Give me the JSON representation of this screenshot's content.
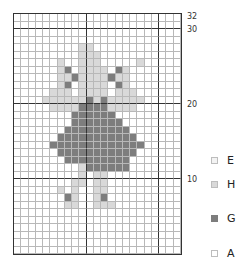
{
  "chart_data": {
    "type": "heatmap",
    "title": "",
    "grid": {
      "rows": 32,
      "cols": 23
    },
    "row_labels": [
      {
        "label": "32",
        "row_from_bottom": 32
      },
      {
        "label": "30",
        "row_from_bottom": 30
      },
      {
        "label": "20",
        "row_from_bottom": 20
      },
      {
        "label": "10",
        "row_from_bottom": 10
      }
    ],
    "thick_lines": {
      "after_cols": [
        10,
        20
      ],
      "after_rows_from_top": [
        2,
        12,
        22
      ]
    },
    "legend": [
      {
        "key": "E",
        "color": "#f3f3f3"
      },
      {
        "key": "H",
        "color": "#d9d9d9"
      },
      {
        "key": "G",
        "color": "#7d7d7d"
      },
      {
        "key": "A",
        "color": "#ffffff"
      }
    ],
    "pattern_rows_top_to_bottom": [
      "AAAAAAAAAAAAAAAAAAAAAAA",
      "AAAAAAAAAAAAAAAAAAAAAAA",
      "AAAAAAAAAAAAAAAAAAAAAAA",
      "AAAAAAAAAAAAAAAAAAAAAAA",
      "AAAAAAAAAHHAAAAAAAAAAAA",
      "AAAAAAAAAHHHAAAAAAAAAAA",
      "AAAAAAHAAHHHAAAAAHAAAAA",
      "AAAAAAHGAHHHHAGHAAAAAAA",
      "AAAAAAHHGHHHHGHHAAAAAAA",
      "AAAAAAHGAHHHHAGHAAAAAAA",
      "AAAAAHHHAHHHHAHHHAAAAAA",
      "AAAAHHHHHHGHGHHHHHAAAAA",
      "AAAAAHHHHGGGGHHHHAAAAAA",
      "AAAAAAAAGGGGGGAAAAAAAAA",
      "AAAAAAAAGGGGGGGAAAAAAAA",
      "AAAAAAAGGGGGGGGGAAAAAAA",
      "AAAAAAGGGGGGGGGGGAAAAAA",
      "AAAAAGGGGGGGGGGGGGAAAAA",
      "AAAAAAGGGGGGGGGGGAAAAAA",
      "AAAAAAAGGGGGGGGGAAAAAAA",
      "AAAAAAAAAHGGGGGGAAAAAAA",
      "AAAAAAAAAHAHHAAAAAAAAAA",
      "AAAAAAAAHHAHHAAAAAAAAAA",
      "AAAAAAHAHAAHHAAAAAAAAAA",
      "AAAAAAAGHAAHGAAAAAAAAAA",
      "AAAAAAAHHAAHHHAAAAAAAAA",
      "AAAAAAAAAAAAAAAAAAAAAAA",
      "AAAAAAAAAAAAAAAAAAAAAAA",
      "AAAAAAAAAAAAAAAAAAAAAAA",
      "AAAAAAAAAAAAAAAAAAAAAAA",
      "AAAAAAAAAAAAAAAAAAAAAAA",
      "AAAAAAAAAAAAAAAAAAAAAAA"
    ]
  },
  "labels": {
    "r32": "32",
    "r30": "30",
    "r20": "20",
    "r10": "10"
  },
  "legend_labels": {
    "e": "E",
    "h": "H",
    "g": "G",
    "a": "A"
  }
}
